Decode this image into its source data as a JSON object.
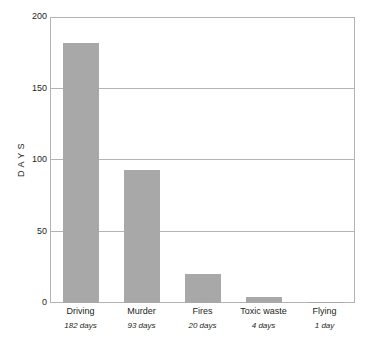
{
  "chart_data": {
    "type": "bar",
    "title": "",
    "subtitle": "",
    "xlabel": "",
    "ylabel": "D  A  Y  S",
    "categories": [
      "Driving",
      "Murder",
      "Fires",
      "Toxic waste",
      "Flying"
    ],
    "values": [
      182,
      93,
      20,
      4,
      1
    ],
    "value_labels": [
      "182 days",
      "93 days",
      "20 days",
      "4 days",
      "1 day"
    ],
    "ylim": [
      0,
      200
    ],
    "y_ticks": [
      0,
      50,
      100,
      150,
      200
    ],
    "y_tick_labels": [
      "0",
      "50",
      "100",
      "150",
      "200"
    ],
    "grid": "horizontal",
    "legend": "none",
    "series": [
      {
        "name": "Days",
        "values": [
          182,
          93,
          20,
          4,
          1
        ]
      }
    ],
    "colors": {
      "bar_fill": "#a8a8a8",
      "gridline": "#b3b3b3",
      "frame": "#b3b3b3",
      "text": "#231f20",
      "background": "#ffffff"
    }
  }
}
